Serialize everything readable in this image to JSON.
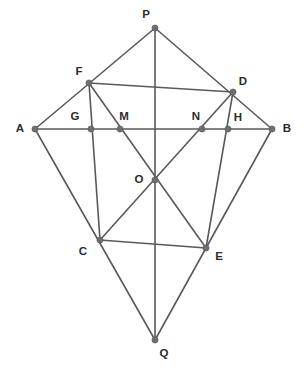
{
  "figure": {
    "width": 304,
    "height": 370,
    "background_color": "#ffffff",
    "line_color": "#59595b",
    "vertex_color": "#6e6e70",
    "label_color": "#2b2b2d"
  },
  "points": [
    {
      "id": "P",
      "label": "P",
      "x": 155,
      "y": 28,
      "label_x": 146,
      "label_y": 15
    },
    {
      "id": "F",
      "label": "F",
      "x": 89,
      "y": 83,
      "label_x": 79,
      "label_y": 72
    },
    {
      "id": "D",
      "label": "D",
      "x": 233,
      "y": 92,
      "label_x": 243,
      "label_y": 82
    },
    {
      "id": "A",
      "label": "A",
      "x": 35,
      "y": 129,
      "label_x": 20,
      "label_y": 129
    },
    {
      "id": "B",
      "label": "B",
      "x": 272,
      "y": 129,
      "label_x": 287,
      "label_y": 129
    },
    {
      "id": "G",
      "label": "G",
      "x": 91,
      "y": 129,
      "label_x": 75,
      "label_y": 117
    },
    {
      "id": "M",
      "label": "M",
      "x": 120,
      "y": 129,
      "label_x": 124,
      "label_y": 117
    },
    {
      "id": "N",
      "label": "N",
      "x": 202,
      "y": 129,
      "label_x": 196,
      "label_y": 117
    },
    {
      "id": "H",
      "label": "H",
      "x": 228,
      "y": 129,
      "label_x": 238,
      "label_y": 118
    },
    {
      "id": "O",
      "label": "O",
      "x": 155,
      "y": 180,
      "label_x": 139,
      "label_y": 180
    },
    {
      "id": "C",
      "label": "C",
      "x": 100,
      "y": 240,
      "label_x": 83,
      "label_y": 252
    },
    {
      "id": "E",
      "label": "E",
      "x": 206,
      "y": 248,
      "label_x": 219,
      "label_y": 257
    },
    {
      "id": "Q",
      "label": "Q",
      "x": 155,
      "y": 340,
      "label_x": 164,
      "label_y": 354
    }
  ],
  "edges": [
    {
      "id": "AP",
      "from": "A",
      "to": "P",
      "name": "segment-a-p"
    },
    {
      "id": "PB",
      "from": "P",
      "to": "B",
      "name": "segment-p-b"
    },
    {
      "id": "AQ",
      "from": "A",
      "to": "Q",
      "name": "segment-a-q"
    },
    {
      "id": "QB",
      "from": "Q",
      "to": "B",
      "name": "segment-q-b"
    },
    {
      "id": "AB",
      "from": "A",
      "to": "B",
      "name": "segment-a-b-horizontal-diagonal"
    },
    {
      "id": "PQ",
      "from": "P",
      "to": "Q",
      "name": "segment-p-q-vertical-diagonal"
    },
    {
      "id": "FC",
      "from": "F",
      "to": "C",
      "name": "segment-f-c"
    },
    {
      "id": "DE",
      "from": "D",
      "to": "E",
      "name": "segment-d-e"
    },
    {
      "id": "FE",
      "from": "F",
      "to": "E",
      "name": "segment-f-e-diagonal"
    },
    {
      "id": "DC",
      "from": "D",
      "to": "C",
      "name": "segment-d-c-diagonal"
    },
    {
      "id": "CE",
      "from": "C",
      "to": "E",
      "name": "segment-c-e"
    },
    {
      "id": "FD",
      "from": "F",
      "to": "D",
      "name": "segment-f-d"
    }
  ],
  "labels_note": {
    "vertex_count": "13",
    "segment_count": "12"
  }
}
